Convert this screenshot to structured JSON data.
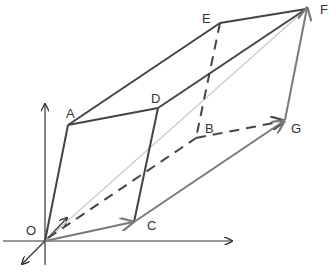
{
  "diagram": {
    "colors": {
      "edge_dark": "#444444",
      "edge_gray": "#7a7a7a",
      "diagonal_light": "#c8c8c8",
      "axis": "#333333"
    },
    "labels": {
      "O": "O",
      "A": "A",
      "B": "B",
      "C": "C",
      "D": "D",
      "E": "E",
      "F": "F",
      "G": "G"
    },
    "edges": [
      {
        "from": "O",
        "to": "A",
        "style": "solid",
        "shade": "dark"
      },
      {
        "from": "A",
        "to": "D",
        "style": "solid",
        "shade": "dark"
      },
      {
        "from": "A",
        "to": "E",
        "style": "solid",
        "shade": "dark"
      },
      {
        "from": "D",
        "to": "C",
        "style": "solid",
        "shade": "dark"
      },
      {
        "from": "D",
        "to": "F",
        "style": "solid",
        "shade": "dark"
      },
      {
        "from": "E",
        "to": "F",
        "style": "solid",
        "shade": "dark"
      },
      {
        "from": "E",
        "to": "B",
        "style": "dashed",
        "shade": "dark"
      },
      {
        "from": "O",
        "to": "B",
        "style": "dashed",
        "shade": "dark"
      },
      {
        "from": "B",
        "to": "G",
        "style": "dashed",
        "shade": "dark",
        "arrow": true
      },
      {
        "from": "O",
        "to": "C",
        "style": "solid",
        "shade": "gray",
        "arrow": true
      },
      {
        "from": "C",
        "to": "G",
        "style": "solid",
        "shade": "gray",
        "arrow": true
      },
      {
        "from": "G",
        "to": "F",
        "style": "solid",
        "shade": "gray",
        "arrow": true
      },
      {
        "from": "O",
        "to": "F",
        "style": "solid",
        "shade": "light"
      }
    ]
  }
}
